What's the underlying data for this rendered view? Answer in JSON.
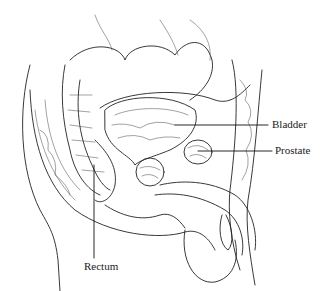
{
  "figure": {
    "style": "black line drawing on white"
  },
  "labels": {
    "bladder": {
      "text": "Bladder"
    },
    "prostate": {
      "text": "Prostate"
    },
    "rectum": {
      "text": "Rectum"
    }
  },
  "colors": {
    "background": "#ffffff",
    "ink": "#222222"
  }
}
